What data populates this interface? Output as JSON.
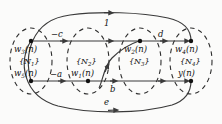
{
  "figure": {
    "type": "signal-flow-graph",
    "background_color": "#fbfbfa",
    "line_color": "#3a3a3a",
    "text_color": "#111111"
  },
  "clusters": [
    {
      "id": "N1",
      "set_label": "{N",
      "set_sub": "1",
      "set_close": "}",
      "top_node": {
        "name": "w",
        "sub": "3",
        "arg": "(n)"
      },
      "bottom_node": {
        "name": "w",
        "sub": "5",
        "arg": "(n)"
      },
      "cx": 31
    },
    {
      "id": "N2",
      "set_label": "{N",
      "set_sub": "2",
      "set_close": "}",
      "top_node": null,
      "bottom_node": {
        "name": "w",
        "sub": "1",
        "arg": "(n)"
      },
      "cx": 88
    },
    {
      "id": "N3",
      "set_label": "{N",
      "set_sub": "3",
      "set_close": "}",
      "top_node": {
        "name": "w",
        "sub": "2",
        "arg": "(n)"
      },
      "bottom_node": null,
      "cx": 140
    },
    {
      "id": "N4",
      "set_label": "{N",
      "set_sub": "4",
      "set_close": "}",
      "top_node": {
        "name": "w",
        "sub": "4",
        "arg": "(n)"
      },
      "bottom_node": {
        "name": "y",
        "sub": "",
        "arg": "(n)"
      },
      "cx": 191
    }
  ],
  "edges": [
    {
      "id": "top-outer",
      "label": "1",
      "shape": "arc-over",
      "direction": "left-to-right"
    },
    {
      "id": "top-row-left",
      "label": "−c",
      "shape": "straight",
      "direction": "left-to-right"
    },
    {
      "id": "top-row-right",
      "label": "d",
      "shape": "straight",
      "direction": "left-to-right"
    },
    {
      "id": "bottom-row-left",
      "label": "−a",
      "shape": "straight",
      "direction": "left-to-right"
    },
    {
      "id": "bottom-row-right",
      "label": "b",
      "shape": "straight",
      "direction": "left-to-right"
    },
    {
      "id": "cross-s-curve",
      "label": "",
      "shape": "s-curve",
      "direction": "bottom-left-to-top-right"
    },
    {
      "id": "bottom-outer",
      "label": "e",
      "shape": "arc-under",
      "direction": "left-to-right"
    }
  ],
  "labels": {
    "edge_1": "1",
    "edge_minus_c": "−c",
    "edge_d": "d",
    "edge_minus_a": "−a",
    "edge_b": "b",
    "edge_e": "e",
    "node_w3": "w",
    "node_w3_sub": "3",
    "node_w3_arg": "(n)",
    "node_w5": "w",
    "node_w5_sub": "5",
    "node_w5_arg": "(n)",
    "node_w1": "w",
    "node_w1_sub": "1",
    "node_w1_arg": "(n)",
    "node_w2": "w",
    "node_w2_sub": "2",
    "node_w2_arg": "(n)",
    "node_w4": "w",
    "node_w4_sub": "4",
    "node_w4_arg": "(n)",
    "node_y": "y",
    "node_y_arg": "(n)",
    "set_N1_open": "{N",
    "set_N1_sub": "1",
    "set_N1_close": "}",
    "set_N2_open": "{N",
    "set_N2_sub": "2",
    "set_N2_close": "}",
    "set_N3_open": "{N",
    "set_N3_sub": "3",
    "set_N3_close": "}",
    "set_N4_open": "{N",
    "set_N4_sub": "4",
    "set_N4_close": "}"
  }
}
